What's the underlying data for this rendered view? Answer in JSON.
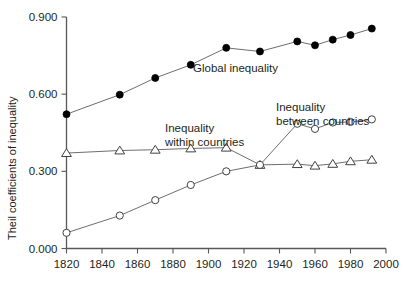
{
  "chart_data": {
    "type": "line",
    "title": "",
    "xlabel": "",
    "ylabel": "Theil coefficients of inequality",
    "xlim": [
      1820,
      2000
    ],
    "ylim": [
      0.0,
      0.9
    ],
    "grid": false,
    "legend_position": "inline-annotations",
    "xticks": [
      1820,
      1840,
      1860,
      1880,
      1900,
      1920,
      1940,
      1960,
      1980,
      2000
    ],
    "xtick_labels": [
      "1820",
      "1840",
      "1860",
      "1880",
      "1900",
      "1920",
      "1940",
      "1960",
      "1980",
      "2000"
    ],
    "yticks": [
      0.0,
      0.3,
      0.6,
      0.9
    ],
    "ytick_labels": [
      "0.000",
      "0.300",
      "0.600",
      "0.900"
    ],
    "series": [
      {
        "name": "Global inequality",
        "marker": "filled-circle",
        "x": [
          1820,
          1850,
          1870,
          1890,
          1910,
          1929,
          1950,
          1960,
          1970,
          1980,
          1992
        ],
        "values": [
          0.522,
          0.598,
          0.663,
          0.714,
          0.78,
          0.766,
          0.805,
          0.79,
          0.812,
          0.83,
          0.855
        ]
      },
      {
        "name": "Inequality within countries",
        "marker": "open-triangle",
        "x": [
          1820,
          1850,
          1870,
          1890,
          1910,
          1929,
          1950,
          1960,
          1970,
          1980,
          1992
        ],
        "values": [
          0.371,
          0.381,
          0.384,
          0.389,
          0.392,
          0.325,
          0.328,
          0.322,
          0.329,
          0.339,
          0.345
        ]
      },
      {
        "name": "Inequality between countries",
        "marker": "open-circle",
        "x": [
          1820,
          1850,
          1870,
          1890,
          1910,
          1929,
          1950,
          1960,
          1970,
          1980,
          1992
        ],
        "values": [
          0.061,
          0.128,
          0.188,
          0.247,
          0.3,
          0.325,
          0.485,
          0.465,
          0.49,
          0.492,
          0.502
        ]
      }
    ],
    "annotations": [
      {
        "text": "Global inequality",
        "series": "Global inequality"
      },
      {
        "text": "Inequality",
        "series": "Inequality within countries"
      },
      {
        "text": "within countries",
        "series": "Inequality within countries"
      },
      {
        "text": "Inequality",
        "series": "Inequality between countries"
      },
      {
        "text": "between countries",
        "series": "Inequality between countries"
      }
    ]
  },
  "colors": {
    "axis": "#58585a",
    "line": "#6d6e70",
    "filled_marker": "#000000",
    "open_marker_stroke": "#414042",
    "text": "#231f20",
    "background": "#ffffff"
  }
}
